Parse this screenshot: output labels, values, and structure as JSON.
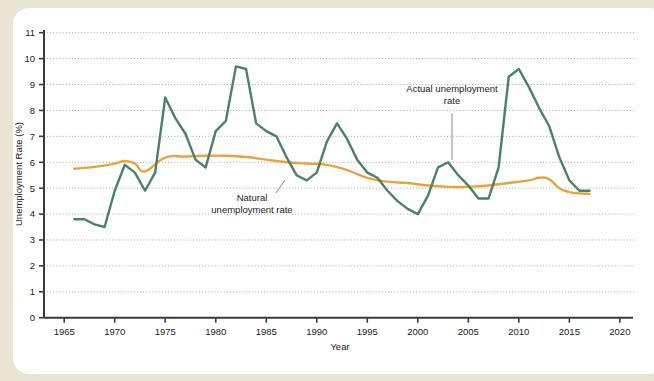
{
  "figure": {
    "background_color": "#e9e4d4",
    "panel_color": "#ffffff"
  },
  "chart_data": {
    "type": "line",
    "title": "",
    "xlabel": "Year",
    "ylabel": "Unemployment Rate (%)",
    "xlim": [
      1963,
      2021.3
    ],
    "ylim": [
      0,
      11.4
    ],
    "xticks": [
      1965,
      1970,
      1975,
      1980,
      1985,
      1990,
      1995,
      2000,
      2005,
      2010,
      2015,
      2020
    ],
    "xtick_labels": [
      "1965",
      "1970",
      "1975",
      "1980",
      "1985",
      "1990",
      "1995",
      "2000",
      "2005",
      "2010",
      "2015",
      "2020"
    ],
    "yticks": [
      0,
      1,
      2,
      3,
      4,
      5,
      6,
      7,
      8,
      9,
      10,
      11
    ],
    "ytick_labels": [
      "0",
      "1",
      "2",
      "3",
      "4",
      "5",
      "6",
      "7",
      "8",
      "9",
      "10",
      "11"
    ],
    "grid": true,
    "grid_style": "dotted-horizontal",
    "legend": "none",
    "series": [
      {
        "name": "Actual unemployment rate",
        "color": "#4b7f6e",
        "x": [
          1966,
          1967,
          1968,
          1969,
          1970,
          1971,
          1972,
          1973,
          1974,
          1975,
          1976,
          1977,
          1978,
          1979,
          1980,
          1981,
          1982,
          1983,
          1984,
          1985,
          1986,
          1987,
          1988,
          1989,
          1990,
          1991,
          1992,
          1993,
          1994,
          1995,
          1996,
          1997,
          1998,
          1999,
          2000,
          2001,
          2002,
          2003,
          2004,
          2005,
          2006,
          2007,
          2008,
          2009,
          2010,
          2011,
          2012,
          2013,
          2014,
          2015,
          2016,
          2017
        ],
        "values": [
          3.8,
          3.8,
          3.6,
          3.5,
          4.9,
          5.9,
          5.6,
          4.9,
          5.6,
          8.5,
          7.7,
          7.1,
          6.1,
          5.8,
          7.2,
          7.6,
          9.7,
          9.6,
          7.5,
          7.2,
          7.0,
          6.2,
          5.5,
          5.3,
          5.6,
          6.8,
          7.5,
          6.9,
          6.1,
          5.6,
          5.4,
          4.9,
          4.5,
          4.2,
          4.0,
          4.7,
          5.8,
          6.0,
          5.5,
          5.1,
          4.6,
          4.6,
          5.8,
          9.3,
          9.6,
          8.9,
          8.1,
          7.4,
          6.2,
          5.3,
          4.9,
          4.9
        ]
      },
      {
        "name": "Natural unemployment rate",
        "color": "#e8a33c",
        "x": [
          1966,
          1968,
          1970,
          1971,
          1972,
          1973,
          1975,
          1977,
          1979,
          1981,
          1983,
          1985,
          1987,
          1989,
          1991,
          1993,
          1995,
          1997,
          1999,
          2001,
          2003,
          2005,
          2007,
          2009,
          2011,
          2012,
          2013,
          2014,
          2015,
          2016,
          2017
        ],
        "values": [
          5.75,
          5.82,
          5.95,
          6.05,
          5.95,
          5.65,
          6.18,
          6.22,
          6.25,
          6.25,
          6.2,
          6.1,
          6.0,
          5.95,
          5.9,
          5.7,
          5.4,
          5.25,
          5.2,
          5.1,
          5.05,
          5.05,
          5.1,
          5.2,
          5.3,
          5.4,
          5.35,
          5.0,
          4.85,
          4.8,
          4.78
        ]
      }
    ],
    "annotations": [
      {
        "name": "natural-rate-annotation",
        "line1": "Natural",
        "line2": "unemployment rate",
        "text_x": 252,
        "text_y": 201,
        "leader_from_x": 276,
        "leader_from_y": 193,
        "leader_to_x": 285,
        "leader_to_y": 180
      },
      {
        "name": "actual-rate-annotation",
        "line1": "Actual unemployment",
        "line2": "rate",
        "text_x": 452,
        "text_y": 92,
        "leader_from_x": 452,
        "leader_from_y": 113,
        "leader_to_x": 452,
        "leader_to_y": 160
      }
    ]
  }
}
